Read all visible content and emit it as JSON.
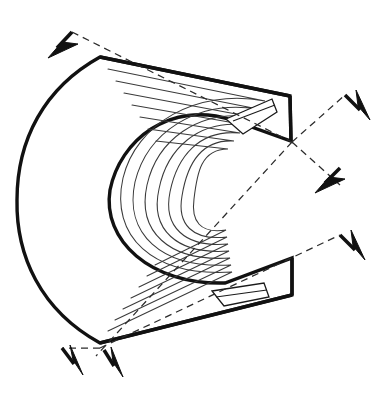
{
  "figure": {
    "title": "Curved laminated core segment with slot openings and directional expansion arrows",
    "type": "line-drawing",
    "background_color": "#ffffff",
    "canvas": {
      "width": 385,
      "height": 405
    },
    "stroke_colors": {
      "outline": "#111111",
      "lamination": "#3a3a3a",
      "slot": "#1a1a1a",
      "dashed_axis": "#2b2b2b",
      "arrow": "#111111"
    }
  },
  "body": {
    "name": "curved-core-body",
    "description": "C-shaped / horseshoe sector body, open toward the right, built from stacked concentric laminations",
    "vertices": {
      "top_left_corner": [
        100,
        57
      ],
      "top_right_corner": [
        290,
        96
      ],
      "top_inner_corner": [
        291,
        141
      ],
      "bottom_inner_corner": [
        292,
        258
      ],
      "bottom_right_corner": [
        292,
        295
      ],
      "bottom_left_corner": [
        100,
        343
      ],
      "left_extreme": [
        17,
        200
      ]
    },
    "outline_path": "M 100 57 L 290 96 L 291 141 L 232 120 C 170 100 120 140 110 190 C 102 240 150 285 225 283 L 292 258 L 292 295 L 100 343 C 40 310 16 255 17 200 C 17 140 44 88 100 57 Z",
    "lamination_count": 7,
    "lamination_paths": [
      "M 108 69 L 265 101 C 196 88 136 124 123 178 C 110 236 152 277 232 272 L 108 331",
      "M 116 81 L 258 109 C 196 99 147 133 135 182 C 124 233 160 269 231 265 L 115 320",
      "M 124 93 L 252 117 C 197 109 157 141 147 185 C 137 231 168 262 230 258 L 123 309",
      "M 132 105 L 246 125 C 198 119 167 149 159 189 C 150 229 176 255 229 251 L 131 298",
      "M 140 117 L 240 133 C 199 129 177 157 170 192 C 163 226 184 248 228 244 L 139 287",
      "M 148 129 L 234 141 C 200 139 187 165 182 196 C 177 224 192 241 227 237 L 147 276",
      "M 156 141 L 228 149 C 201 149 197 173 194 199 C 191 221 200 234 226 230 L 155 265"
    ]
  },
  "slots": [
    {
      "name": "upper-slot",
      "description": "Elongated rectangular slot opening near the upper right mouth of the C",
      "polygon": "226 119 272 99 277 112 243 134",
      "divider": "M 233 121 L 275 105"
    },
    {
      "name": "lower-slot",
      "description": "Elongated rectangular slot opening near the lower right mouth of the C",
      "polygon": "212 291 264 283 269 297 224 306",
      "divider": "M 216 297 L 267 290"
    }
  ],
  "axes": [
    {
      "name": "axis-upper-left-to-center",
      "description": "Dashed construction line from upper-left arrow vertex through the body to the central crossing point",
      "path": "M 72 32 L 292 142"
    },
    {
      "name": "axis-center-to-upper-right",
      "description": "Dashed construction line from central crossing point up-right to the top-right arrow vertex",
      "path": "M 292 142 L 345 95"
    },
    {
      "name": "axis-center-to-lower-right",
      "description": "Dashed construction line from central crossing point down-right to the right-middle arrow vertex",
      "path": "M 292 142 L 340 185"
    },
    {
      "name": "axis-center-to-lower-left",
      "description": "Dashed construction line from central crossing point down-left to the bottom-left arrow vertex",
      "path": "M 292 142 L 96 356"
    },
    {
      "name": "axis-lower-mouth-to-right",
      "description": "Dashed construction line from the bottom-left vertex up-right to the lower-right arrow vertex",
      "path": "M 100 348 L 340 235"
    },
    {
      "name": "axis-bottom-left-short",
      "description": "Short dashed line from the bottom-left vertex out to the leftmost bottom arrow vertex",
      "path": "M 100 348 L 62 348"
    }
  ],
  "arrows": [
    {
      "name": "arrow-top-left",
      "direction": "down-left",
      "vertex": [
        72,
        32
      ],
      "tip": [
        57,
        48
      ],
      "stem": "M 72 32 L 57 48",
      "head": "48 58 78 44 62 42"
    },
    {
      "name": "arrow-top-right-outer",
      "direction": "down-right",
      "vertex": [
        345,
        95
      ],
      "tip": [
        360,
        110
      ],
      "stem": "M 345 95 L 360 110",
      "head": "370 120 356 90 358 106"
    },
    {
      "name": "arrow-right-upper",
      "direction": "down-left",
      "vertex": [
        340,
        168
      ],
      "tip": [
        325,
        183
      ],
      "stem": "M 340 168 L 325 183",
      "head": "315 193 345 179 329 177"
    },
    {
      "name": "arrow-right-lower",
      "direction": "down-right",
      "vertex": [
        340,
        235
      ],
      "tip": [
        355,
        250
      ],
      "stem": "M 340 235 L 355 250",
      "head": "365 260 351 230 353 246"
    },
    {
      "name": "arrow-bottom-left-outer",
      "direction": "down-right",
      "vertex": [
        62,
        348
      ],
      "tip": [
        74,
        364
      ],
      "stem": "M 62 348 L 74 364",
      "head": "83 375 70 345 73 360"
    },
    {
      "name": "arrow-bottom-left-inner",
      "direction": "down-right",
      "vertex": [
        104,
        350
      ],
      "tip": [
        114,
        366
      ],
      "stem": "M 104 350 L 114 366",
      "head": "123 377 111 347 113 362"
    }
  ]
}
